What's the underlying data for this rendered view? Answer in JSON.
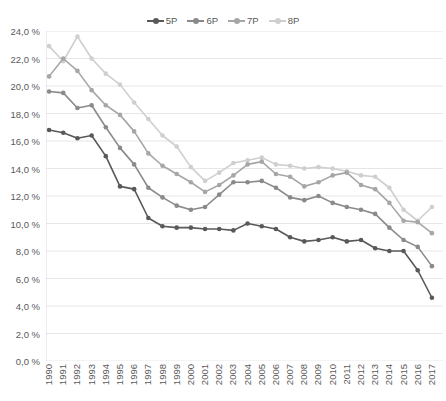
{
  "chart_data": {
    "type": "line",
    "title": "",
    "xlabel": "",
    "ylabel": "",
    "ylim": [
      0,
      24
    ],
    "ytick_step": 2,
    "grid": true,
    "legend_position": "top-center",
    "x": [
      1990,
      1991,
      1992,
      1993,
      1994,
      1995,
      1996,
      1997,
      1998,
      1999,
      2000,
      2001,
      2002,
      2003,
      2004,
      2005,
      2006,
      2007,
      2008,
      2009,
      2010,
      2011,
      2012,
      2013,
      2014,
      2015,
      2016,
      2017
    ],
    "categories": [
      "1990",
      "1991",
      "1992",
      "1993",
      "1994",
      "1995",
      "1996",
      "1997",
      "1998",
      "1999",
      "2000",
      "2001",
      "2002",
      "2003",
      "2004",
      "2005",
      "2006",
      "2007",
      "2008",
      "2009",
      "2010",
      "2011",
      "2012",
      "2013",
      "2014",
      "2015",
      "2016",
      "2017"
    ],
    "ytick_labels": [
      "0,0 %",
      "2,0 %",
      "4,0 %",
      "6,0 %",
      "8,0 %",
      "10,0 %",
      "12,0 %",
      "14,0 %",
      "16,0 %",
      "18,0 %",
      "20,0 %",
      "22,0 %",
      "24,0 %"
    ],
    "ytick_values": [
      0,
      2,
      4,
      6,
      8,
      10,
      12,
      14,
      16,
      18,
      20,
      22,
      24
    ],
    "series": [
      {
        "name": "5P",
        "color": "#595959",
        "values": [
          16.8,
          16.6,
          16.2,
          16.4,
          14.9,
          12.7,
          12.5,
          10.4,
          9.8,
          9.7,
          9.7,
          9.6,
          9.6,
          9.5,
          10.0,
          9.8,
          9.6,
          9.0,
          8.7,
          8.8,
          9.0,
          8.7,
          8.8,
          8.2,
          8.0,
          8.0,
          6.6,
          4.6
        ]
      },
      {
        "name": "6P",
        "color": "#8a8a8a",
        "values": [
          19.6,
          19.5,
          18.4,
          18.6,
          17.0,
          15.5,
          14.3,
          12.6,
          11.9,
          11.3,
          11.0,
          11.2,
          12.1,
          13.0,
          13.0,
          13.1,
          12.6,
          11.9,
          11.7,
          12.0,
          11.5,
          11.2,
          11.0,
          10.7,
          9.7,
          8.8,
          8.3,
          6.9
        ]
      },
      {
        "name": "7P",
        "color": "#a6a6a6",
        "values": [
          20.7,
          22.0,
          21.1,
          19.7,
          18.6,
          17.9,
          16.7,
          15.1,
          14.2,
          13.6,
          13.0,
          12.3,
          12.8,
          13.5,
          14.3,
          14.5,
          13.6,
          13.4,
          12.7,
          13.0,
          13.5,
          13.7,
          12.8,
          12.5,
          11.5,
          10.2,
          10.1,
          9.3
        ]
      },
      {
        "name": "8P",
        "color": "#cfcfcf",
        "values": [
          22.9,
          21.8,
          23.6,
          22.0,
          20.9,
          20.1,
          18.8,
          17.6,
          16.4,
          15.6,
          14.1,
          13.1,
          13.7,
          14.4,
          14.6,
          14.8,
          14.3,
          14.2,
          14.0,
          14.1,
          14.0,
          13.8,
          13.5,
          13.4,
          12.6,
          11.0,
          10.2,
          11.2
        ]
      }
    ]
  },
  "legend": {
    "items": [
      {
        "label": "5P",
        "color": "#595959"
      },
      {
        "label": "6P",
        "color": "#8a8a8a"
      },
      {
        "label": "7P",
        "color": "#a6a6a6"
      },
      {
        "label": "8P",
        "color": "#cfcfcf"
      }
    ]
  },
  "axes": {
    "grid_color": "#e6e6e6",
    "tick_color": "#5a5a5a"
  }
}
